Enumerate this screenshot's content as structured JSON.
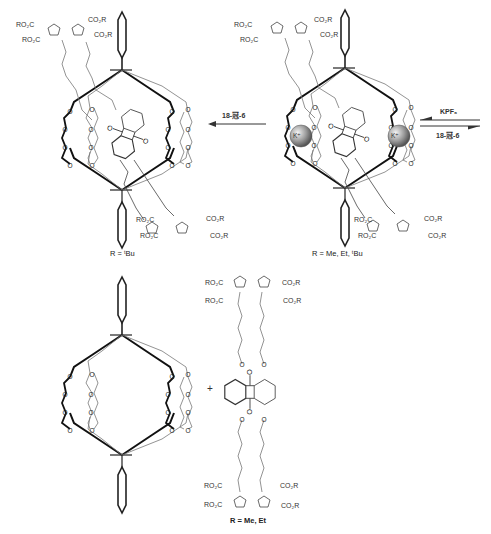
{
  "scheme": {
    "title": "Host-guest complexation / decomplexation scheme",
    "top_left": {
      "caption": "R = ᵗBu",
      "ester_labels": [
        "RO₂C",
        "RO₂C",
        "CO₂R",
        "CO₂R",
        "RO₂C",
        "RO₂C",
        "CO₂R",
        "CO₂R"
      ]
    },
    "top_right": {
      "caption": "R = Me, Et, ᵗBu",
      "cation_label": "K⁺",
      "ester_labels": [
        "RO₂C",
        "RO₂C",
        "CO₂R",
        "CO₂R",
        "RO₂C",
        "RO₂C",
        "CO₂R",
        "CO₂R"
      ]
    },
    "arrow_left": {
      "label": "18-冠-6",
      "direction": "left"
    },
    "arrow_right": {
      "top_label": "KPF₆",
      "bottom_label": "18-冠-6",
      "type": "equilibrium"
    },
    "bottom": {
      "plus": "+",
      "caption": "R = Me, Et",
      "ester_labels": [
        "RO₂C",
        "RO₂C",
        "CO₂R",
        "CO₂R",
        "RO₂C",
        "RO₂C",
        "CO₂R",
        "CO₂R"
      ],
      "atom_O": "O",
      "atom_N": "N"
    }
  }
}
